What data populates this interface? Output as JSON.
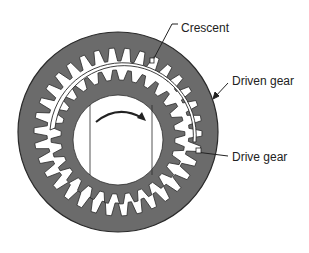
{
  "diagram": {
    "type": "internal gear pump cross-section",
    "labels": {
      "crescent": "Crescent",
      "driven_gear": "Driven gear",
      "drive_gear": "Drive gear"
    },
    "rotation_direction": "clockwise",
    "colors": {
      "gear_fill": "#6b6b6b",
      "gear_outline": "#2a2a2a",
      "background": "#ffffff",
      "crescent_fill": "#ffffff",
      "text": "#222222"
    },
    "geometry": {
      "center": [
        118,
        132
      ],
      "driven_outer_radius": 100,
      "driven_tooth_tip_radius": 71,
      "driven_root_radius": 84,
      "driven_teeth": 34,
      "drive_tip_radius": 75,
      "drive_root_radius": 63,
      "drive_center": [
        118,
        137
      ],
      "drive_teeth": 28,
      "bore_radius": 45
    }
  }
}
